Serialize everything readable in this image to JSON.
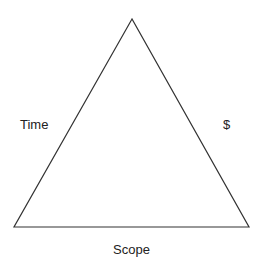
{
  "diagram": {
    "type": "triangle",
    "labels": {
      "left_side": "Time",
      "right_side": "$",
      "bottom_side": "Scope"
    },
    "colors": {
      "stroke": "#333333",
      "text": "#222222",
      "background": "#ffffff"
    }
  }
}
